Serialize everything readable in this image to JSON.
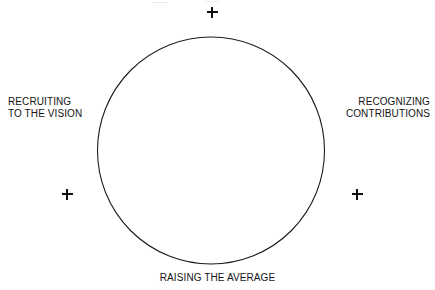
{
  "diagram": {
    "shape": {
      "name": "circle",
      "center_x": 211,
      "center_y": 150,
      "radius": 113,
      "stroke_color": "#1c1c1c",
      "fill": "none"
    },
    "labels": {
      "top": "",
      "left_line1": "RECRUITING",
      "left_line2": "TO THE VISION",
      "right_line1": "RECOGNIZING",
      "right_line2": "CONTRIBUTIONS",
      "bottom": "RAISING THE AVERAGE"
    },
    "markers": {
      "top": "+",
      "left": "+",
      "right": "+"
    },
    "colors": {
      "background": "#ffffff",
      "ink": "#141414",
      "stroke": "#1c1c1c"
    }
  }
}
